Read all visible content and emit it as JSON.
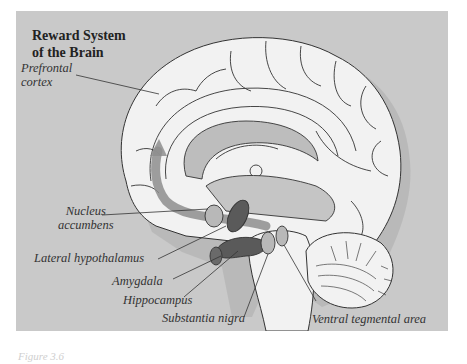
{
  "figure": {
    "title_line1": "Reward System",
    "title_line2": "of the Brain",
    "caption": "Figure 3.6",
    "background_color": "#c9c9c9",
    "brain_fill": "#f2f2f2",
    "pathway_color": "#8e8e8e",
    "structure_dark": "#5a5a5a",
    "structure_light": "#b8b8b8"
  },
  "labels": {
    "prefrontal_cortex_1": "Prefrontal",
    "prefrontal_cortex_2": "cortex",
    "nucleus_accumbens_1": "Nucleus",
    "nucleus_accumbens_2": "accumbens",
    "lateral_hypothalamus": "Lateral hypothalamus",
    "amygdala": "Amygdala",
    "hippocampus": "Hippocampus",
    "substantia_nigra": "Substantia nigra",
    "ventral_tegmental_area": "Ventral tegmental area"
  }
}
